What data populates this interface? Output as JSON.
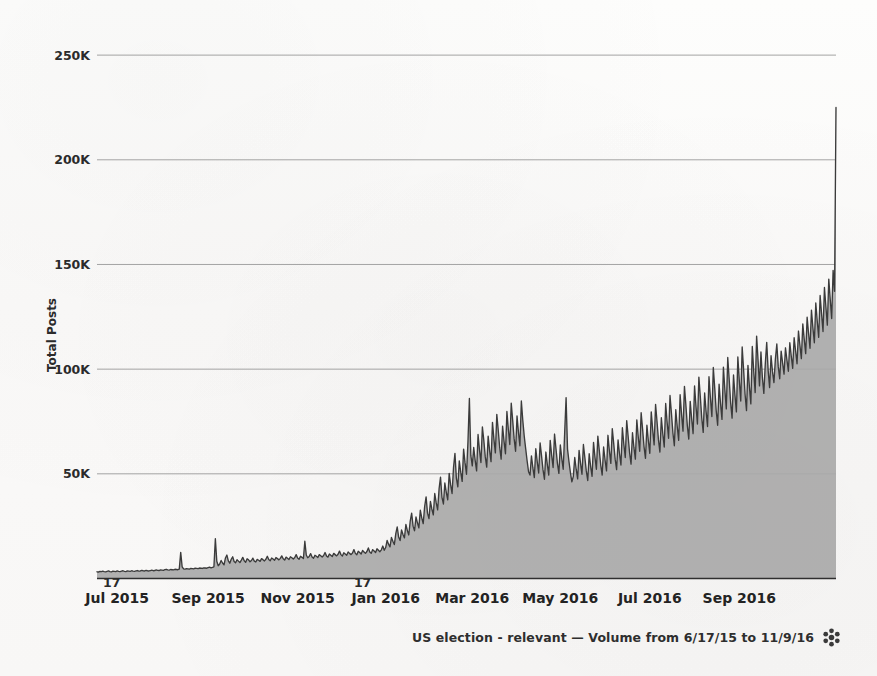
{
  "chart_data": {
    "type": "area",
    "title": "",
    "xlabel": "",
    "ylabel": "Total Posts",
    "ylim": [
      0,
      262000
    ],
    "grid": true,
    "legend": false,
    "caption": "US election - relevant — Volume from 6/17/15 to 11/9/16",
    "series_name": "US election - relevant",
    "date_range": {
      "from": "6/17/15",
      "to": "11/9/16"
    },
    "y_ticks": [
      {
        "value": 50000,
        "label": "50K"
      },
      {
        "value": 100000,
        "label": "100K"
      },
      {
        "value": 150000,
        "label": "150K"
      },
      {
        "value": 200000,
        "label": "200K"
      },
      {
        "value": 250000,
        "label": "250K"
      }
    ],
    "x_ticks": [
      {
        "label": "Jul 2015",
        "index": 14
      },
      {
        "label": "Sep 2015",
        "index": 77
      },
      {
        "label": "Nov 2015",
        "index": 139
      },
      {
        "label": "Jan 2016",
        "index": 200
      },
      {
        "label": "Mar 2016",
        "index": 260
      },
      {
        "label": "May 2016",
        "index": 321
      },
      {
        "label": "Jul 2016",
        "index": 383
      },
      {
        "label": "Sep 2016",
        "index": 445
      }
    ],
    "x_minor_ticks": [
      {
        "label": "17",
        "index": 0
      },
      {
        "label": "17",
        "index": 184
      }
    ],
    "peak_annotation": {
      "label": "Election day spike",
      "value": 225000
    },
    "values": [
      3200,
      3100,
      3400,
      3300,
      3500,
      3300,
      3200,
      3400,
      3600,
      3300,
      3200,
      3500,
      3400,
      3300,
      3600,
      3400,
      3300,
      3500,
      3700,
      3400,
      3300,
      3600,
      3500,
      3400,
      3700,
      3500,
      3400,
      3600,
      3800,
      3500,
      3600,
      3900,
      3700,
      3600,
      3900,
      3700,
      3600,
      3800,
      4000,
      3700,
      3800,
      4100,
      3900,
      3800,
      4100,
      4000,
      3900,
      4200,
      4400,
      4100,
      4000,
      4300,
      4200,
      4100,
      4400,
      4300,
      4200,
      4500,
      12500,
      5600,
      4600,
      4500,
      4700,
      4600,
      4500,
      4800,
      4700,
      4600,
      4900,
      4800,
      4700,
      5000,
      4900,
      4800,
      5100,
      5000,
      4900,
      5200,
      5400,
      5100,
      5300,
      5600,
      19000,
      8200,
      6100,
      6900,
      8600,
      7400,
      6500,
      9800,
      11200,
      8400,
      7300,
      9200,
      10400,
      8100,
      7500,
      9000,
      8300,
      7600,
      8800,
      10100,
      8500,
      7800,
      9400,
      8900,
      8000,
      8600,
      9700,
      8300,
      7900,
      9100,
      8700,
      8200,
      9500,
      9000,
      8400,
      9200,
      10600,
      9100,
      8500,
      9800,
      9300,
      8700,
      10000,
      9500,
      8900,
      9600,
      10800,
      9400,
      8800,
      10200,
      9700,
      9100,
      10400,
      9900,
      9300,
      10000,
      11400,
      9800,
      9200,
      10600,
      10100,
      9500,
      17800,
      11200,
      9900,
      10500,
      11900,
      10300,
      9700,
      11100,
      10600,
      10000,
      11400,
      10900,
      10300,
      11000,
      12400,
      10800,
      10200,
      11700,
      11100,
      10500,
      12000,
      11400,
      10800,
      11600,
      13100,
      11400,
      10700,
      12300,
      11700,
      11100,
      12700,
      12000,
      11400,
      12200,
      13800,
      12000,
      11300,
      13000,
      12400,
      11700,
      13400,
      12700,
      12000,
      12900,
      14600,
      12700,
      12000,
      13800,
      13100,
      12400,
      14200,
      13500,
      12800,
      13700,
      15500,
      13500,
      14800,
      18200,
      16400,
      15100,
      19600,
      17800,
      16200,
      21400,
      24600,
      19800,
      18100,
      23200,
      21000,
      19400,
      25800,
      23000,
      20800,
      27400,
      31200,
      25000,
      22800,
      29400,
      26600,
      24200,
      32600,
      29000,
      26200,
      34400,
      39000,
      31200,
      28600,
      36800,
      33200,
      30400,
      40600,
      36200,
      32800,
      42800,
      48400,
      38800,
      35600,
      45600,
      41200,
      37600,
      50200,
      44800,
      40600,
      53000,
      59800,
      47800,
      43800,
      56200,
      50800,
      46400,
      61800,
      55200,
      49800,
      65200,
      86000,
      58800,
      53800,
      62600,
      56400,
      51400,
      68800,
      61400,
      55400,
      72400,
      66000,
      58200,
      53200,
      68000,
      61200,
      55800,
      74600,
      66600,
      60000,
      78400,
      70800,
      62600,
      57000,
      72800,
      65600,
      59600,
      79800,
      71200,
      64000,
      83800,
      75600,
      66800,
      60800,
      77600,
      69800,
      63400,
      84800,
      75600,
      68000,
      62000,
      56200,
      51000,
      49400,
      58600,
      52800,
      48200,
      62000,
      55800,
      50400,
      64800,
      58600,
      52000,
      47400,
      60400,
      54400,
      49400,
      66000,
      58800,
      53000,
      69000,
      62000,
      55000,
      50200,
      63800,
      57400,
      52200,
      69400,
      86400,
      61800,
      55800,
      50600,
      46200,
      48800,
      57800,
      52200,
      47600,
      61200,
      55000,
      49800,
      64000,
      57800,
      51400,
      46800,
      59600,
      53600,
      48800,
      65000,
      58000,
      52200,
      68000,
      61200,
      54200,
      49400,
      62800,
      56600,
      51400,
      68400,
      61000,
      55000,
      71600,
      64400,
      57000,
      52000,
      66200,
      59600,
      54200,
      72000,
      64200,
      57800,
      75400,
      67800,
      60000,
      54600,
      69600,
      62600,
      57000,
      75800,
      67600,
      60800,
      79200,
      71400,
      63000,
      57400,
      73200,
      65800,
      59800,
      79600,
      71000,
      63800,
      83200,
      75000,
      66200,
      60400,
      76800,
      69200,
      62800,
      83600,
      74600,
      67000,
      87400,
      78800,
      69600,
      63400,
      80600,
      72600,
      66000,
      87800,
      78400,
      70400,
      91800,
      82800,
      73000,
      66600,
      84600,
      76200,
      69200,
      92000,
      82200,
      73800,
      96200,
      86800,
      76600,
      69800,
      88600,
      79800,
      72600,
      96400,
      86200,
      77400,
      100800,
      90800,
      80200,
      73200,
      92800,
      83600,
      76000,
      101000,
      90200,
      81000,
      105600,
      95200,
      84000,
      76600,
      97200,
      87600,
      79600,
      105800,
      94600,
      84800,
      110600,
      99600,
      88000,
      80200,
      101800,
      91600,
      83400,
      110800,
      99000,
      88800,
      115800,
      104200,
      92000,
      108200,
      96000,
      88400,
      102600,
      112800,
      99400,
      91200,
      106400,
      98800,
      93600,
      104800,
      112000,
      101200,
      95400,
      108600,
      103000,
      97600,
      110200,
      104400,
      99000,
      112600,
      106200,
      100400,
      115000,
      108800,
      102600,
      118200,
      111400,
      105000,
      121600,
      114200,
      107400,
      124800,
      117000,
      110000,
      128200,
      119800,
      112600,
      131600,
      123000,
      115200,
      135200,
      126400,
      118000,
      139000,
      129800,
      121000,
      143000,
      133400,
      124200,
      147200,
      137200,
      225000
    ]
  }
}
